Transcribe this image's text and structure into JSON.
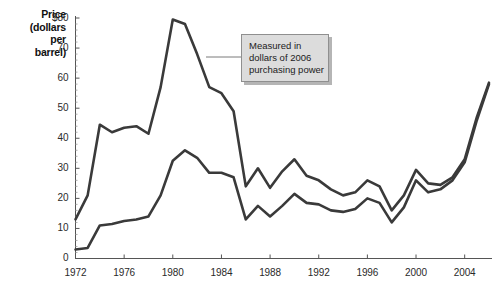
{
  "chart_data": {
    "type": "line",
    "title": "",
    "xlabel": "",
    "ylabel": "Price (dollars per barrel)",
    "ylabel_lines": [
      "Price",
      "(dollars",
      "per",
      "barrel)"
    ],
    "xlim": [
      1972,
      2006
    ],
    "ylim": [
      0,
      80
    ],
    "ytick_labels": [
      "$80",
      "70",
      "60",
      "50",
      "40",
      "30",
      "20",
      "10",
      "0"
    ],
    "ytick_values": [
      80,
      70,
      60,
      50,
      40,
      30,
      20,
      10,
      0
    ],
    "xtick_labels": [
      "1972",
      "1976",
      "1980",
      "1984",
      "1988",
      "1992",
      "1996",
      "2000",
      "2004"
    ],
    "xtick_values": [
      1972,
      1976,
      1980,
      1984,
      1988,
      1992,
      1996,
      2000,
      2004
    ],
    "grid": false,
    "legend": "none",
    "x": [
      1972,
      1973,
      1974,
      1975,
      1976,
      1977,
      1978,
      1979,
      1980,
      1981,
      1982,
      1983,
      1984,
      1985,
      1986,
      1987,
      1988,
      1989,
      1990,
      1991,
      1992,
      1993,
      1994,
      1995,
      1996,
      1997,
      1998,
      1999,
      2000,
      2001,
      2002,
      2003,
      2004,
      2005,
      2006
    ],
    "series": [
      {
        "name": "Real price (2006 dollars)",
        "annotation": "Measured in dollars of 2006 purchasing power",
        "color": "#3a3a3a",
        "values": [
          13,
          21,
          44.5,
          42,
          43.5,
          44,
          41.5,
          57,
          79.5,
          78,
          68,
          57,
          55,
          49,
          24,
          30,
          23.5,
          29,
          33,
          27.5,
          26,
          23,
          21,
          22,
          26,
          24,
          16,
          21,
          29.5,
          25,
          24.5,
          27,
          33,
          47,
          58.5
        ]
      },
      {
        "name": "Nominal price",
        "color": "#3a3a3a",
        "values": [
          3,
          3.5,
          11,
          11.5,
          12.5,
          13,
          14,
          21,
          32.5,
          36,
          33.5,
          28.5,
          28.5,
          27,
          13,
          17.5,
          14,
          17.5,
          21.5,
          18.5,
          18,
          16,
          15.5,
          16.5,
          20,
          18.5,
          12,
          17,
          26,
          22,
          23,
          26,
          32,
          46,
          58
        ]
      }
    ],
    "annotations": [
      {
        "name": "purchasing-power-note",
        "lines": [
          "Measured in",
          "dollars of 2006",
          "purchasing power"
        ],
        "leader_from_x": 205,
        "leader_to_x": 240,
        "leader_y": 57
      }
    ]
  },
  "axis": {
    "tick_color": "#555555",
    "line_color": "#555555"
  }
}
